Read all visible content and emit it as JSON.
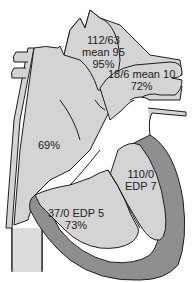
{
  "diagram": {
    "title_partial": "",
    "colors": {
      "background": "#ffffff",
      "chamber_light": "#d4d4d4",
      "myocardium": "#8f8f8f",
      "outline": "#1e1e1e",
      "text": "#222222"
    },
    "labels": {
      "aorta": {
        "line1": "112/63",
        "line2": "mean 95",
        "line3": "95%"
      },
      "pulmonary_artery": {
        "line1": "18/6 mean 10",
        "line2": "72%"
      },
      "right_atrium": {
        "line1": "69%"
      },
      "left_ventricle": {
        "line1": "110/0",
        "line2": "EDP 7"
      },
      "right_ventricle": {
        "line1": "37/0 EDP 5",
        "line2": "73%"
      }
    }
  }
}
